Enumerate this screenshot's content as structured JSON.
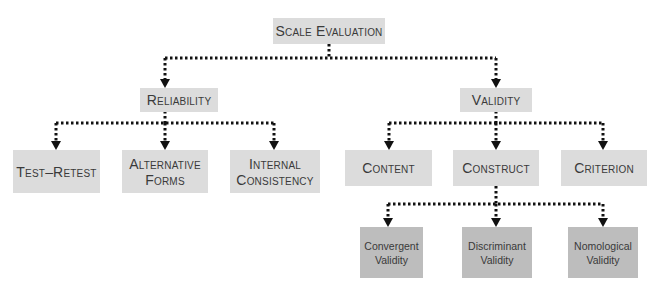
{
  "diagram": {
    "root": {
      "label": "Scale Evaluation"
    },
    "level1": [
      {
        "label": "Reliability"
      },
      {
        "label": "Validity"
      }
    ],
    "reliability_children": [
      {
        "label": "Test–Retest"
      },
      {
        "label": "Alternative",
        "label2": "Forms"
      },
      {
        "label": "Internal",
        "label2": "Consistency"
      }
    ],
    "validity_children": [
      {
        "label": "Content"
      },
      {
        "label": "Construct"
      },
      {
        "label": "Criterion"
      }
    ],
    "construct_children": [
      {
        "label": "Convergent",
        "label2": "Validity"
      },
      {
        "label": "Discriminant",
        "label2": "Validity"
      },
      {
        "label": "Nomological",
        "label2": "Validity"
      }
    ],
    "colors": {
      "light_box": "#dcdcdc",
      "dark_box": "#bdbdbd",
      "connector": "#111111"
    }
  }
}
